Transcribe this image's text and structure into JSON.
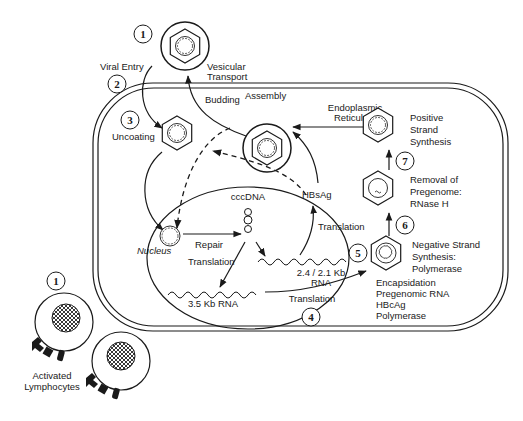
{
  "diagram": {
    "steps": {
      "s1_top": "1",
      "s2": "2",
      "s3": "3",
      "s4": "4",
      "s5": "5",
      "s6": "6",
      "s7": "7",
      "s1_lymph": "1"
    },
    "labels": {
      "viral_entry": "Viral Entry",
      "vesicular_1": "Vesicular",
      "vesicular_2": "Transport",
      "uncoating": "Uncoating",
      "budding": "Budding",
      "assembly": "Assembly",
      "er_1": "Endoplasmic",
      "er_2": "Reticulum",
      "positive_1": "Positive",
      "positive_2": "Strand",
      "positive_3": "Synthesis",
      "removal_1": "Removal of",
      "removal_2": "Pregenome:",
      "removal_3": "RNase H",
      "negative_1": "Negative Strand",
      "negative_2": "Synthesis:",
      "negative_3": "Polymerase",
      "encaps_1": "Encapsidation",
      "encaps_2": "Pregenomic RNA",
      "encaps_3": "HBcAg",
      "encaps_4": "Polymerase",
      "cccdna": "cccDNA",
      "nucleus": "Nucleus",
      "repair": "Repair",
      "translation_left": "Translation",
      "translation_right": "Translation",
      "translation_bottom": "Translation",
      "hbsag": "HBsAg",
      "rna_35": "3.5 Kb RNA",
      "rna_24_1": "2.4 / 2.1 Kb",
      "rna_24_2": "RNA",
      "lymph_1": "Activated",
      "lymph_2": "Lymphocytes"
    },
    "colors": {
      "stroke": "#1a1a1a",
      "background": "#ffffff"
    }
  }
}
